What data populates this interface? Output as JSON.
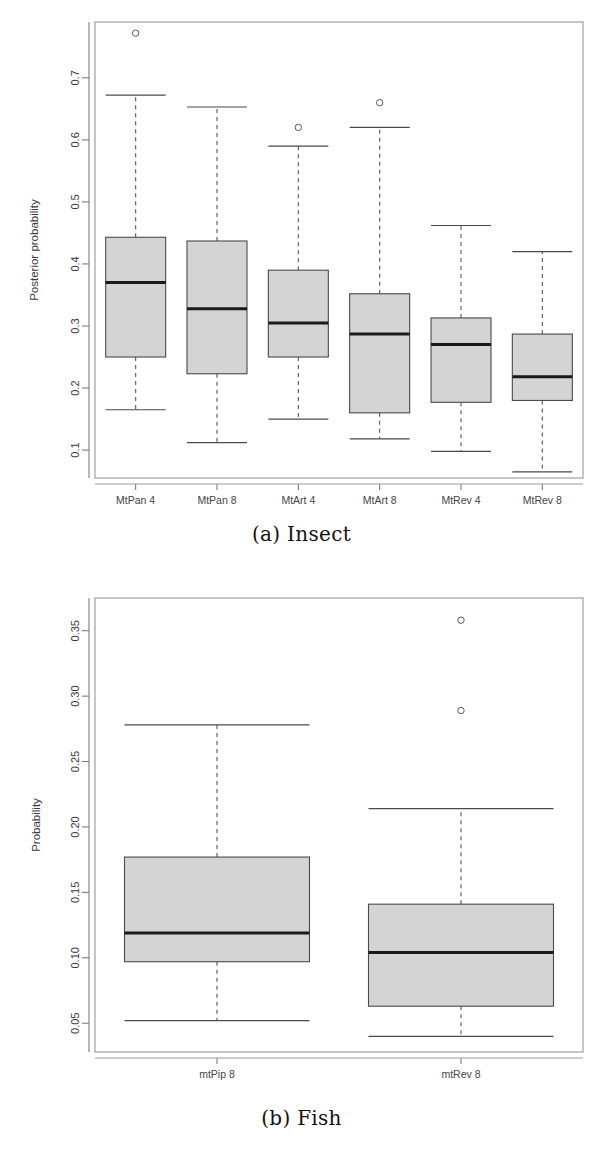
{
  "page": {
    "background": "#ffffff",
    "box_fill": "#d4d4d4",
    "box_stroke": "#4a4a4a",
    "median_color": "#1a1a1a",
    "whisker_color": "#555555"
  },
  "figures": [
    {
      "id": "figure-a",
      "caption": "(a) Insect",
      "chart_data": {
        "type": "box",
        "title": "",
        "xlabel": "",
        "ylabel": "Posterior probability",
        "ylim": [
          0.055,
          0.79
        ],
        "yticks": [
          0.1,
          0.2,
          0.3,
          0.4,
          0.5,
          0.6,
          0.7
        ],
        "ytick_labels": [
          "0.1",
          "0.2",
          "0.3",
          "0.4",
          "0.5",
          "0.6",
          "0.7"
        ],
        "grid": false,
        "legend": "none",
        "categories": [
          "MtPan 4",
          "MtPan 8",
          "MtArt 4",
          "MtArt 8",
          "MtRev 4",
          "MtRev 8"
        ],
        "boxes": [
          {
            "category": "MtPan 4",
            "whisker_low": 0.165,
            "q1": 0.25,
            "median": 0.37,
            "q3": 0.443,
            "whisker_high": 0.672,
            "outliers": [
              0.772
            ]
          },
          {
            "category": "MtPan 8",
            "whisker_low": 0.112,
            "q1": 0.223,
            "median": 0.328,
            "q3": 0.437,
            "whisker_high": 0.653,
            "outliers": []
          },
          {
            "category": "MtArt 4",
            "whisker_low": 0.15,
            "q1": 0.25,
            "median": 0.305,
            "q3": 0.39,
            "whisker_high": 0.59,
            "outliers": [
              0.62
            ]
          },
          {
            "category": "MtArt 8",
            "whisker_low": 0.118,
            "q1": 0.16,
            "median": 0.287,
            "q3": 0.352,
            "whisker_high": 0.62,
            "outliers": [
              0.66
            ]
          },
          {
            "category": "MtRev 4",
            "whisker_low": 0.098,
            "q1": 0.177,
            "median": 0.27,
            "q3": 0.313,
            "whisker_high": 0.462,
            "outliers": []
          },
          {
            "category": "MtRev 8",
            "whisker_low": 0.065,
            "q1": 0.18,
            "median": 0.218,
            "q3": 0.287,
            "whisker_high": 0.42,
            "outliers": []
          }
        ]
      }
    },
    {
      "id": "figure-b",
      "caption": "(b) Fish",
      "chart_data": {
        "type": "box",
        "title": "",
        "xlabel": "",
        "ylabel": "Probability",
        "ylim": [
          0.028,
          0.375
        ],
        "yticks": [
          0.05,
          0.1,
          0.15,
          0.2,
          0.25,
          0.3,
          0.35
        ],
        "ytick_labels": [
          "0.05",
          "0.10",
          "0.15",
          "0.20",
          "0.25",
          "0.30",
          "0.35"
        ],
        "grid": false,
        "legend": "none",
        "categories": [
          "mtPip 8",
          "mtRev 8"
        ],
        "boxes": [
          {
            "category": "mtPip 8",
            "whisker_low": 0.052,
            "q1": 0.097,
            "median": 0.119,
            "q3": 0.177,
            "whisker_high": 0.278,
            "outliers": []
          },
          {
            "category": "mtRev 8",
            "whisker_low": 0.04,
            "q1": 0.063,
            "median": 0.104,
            "q3": 0.141,
            "whisker_high": 0.214,
            "outliers": [
              0.289,
              0.358
            ]
          }
        ]
      }
    }
  ]
}
